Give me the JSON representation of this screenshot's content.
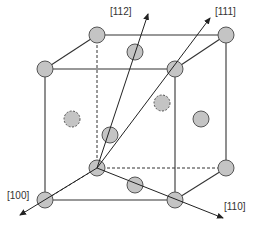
{
  "diagram": {
    "type": "fcc-unit-cell-directions",
    "colors": {
      "atom_fill": "#c4c4c4",
      "atom_stroke": "#555555",
      "line": "#333333"
    },
    "labels": {
      "d112": "[112]",
      "d111": "[111]",
      "d100": "[100]",
      "d110": "[110]"
    }
  }
}
